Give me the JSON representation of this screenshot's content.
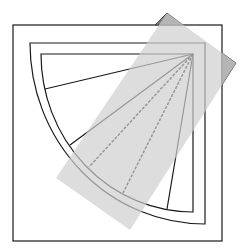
{
  "diagram": {
    "colors": {
      "background": "#ffffff",
      "stroke": "#1a1a1a",
      "overlay_fill": "#d9d9d9",
      "overlay_opacity": 0.85,
      "overlay_tip_fill": "#7a7a7a"
    },
    "outer_square": {
      "x": 13,
      "y": 25,
      "w": 209,
      "h": 216
    },
    "middle_frame": {
      "x": 30,
      "y": 43,
      "right": 205,
      "bottom": 224
    },
    "inner_frame": {
      "x": 41,
      "y": 54,
      "right": 193,
      "bottom": 212
    },
    "apex": {
      "x": 193,
      "y": 54
    },
    "rays": [
      {
        "end_x": 45,
        "end_y": 89,
        "style": "solid"
      },
      {
        "end_x": 70,
        "end_y": 145,
        "style": "solid"
      },
      {
        "end_x": 89,
        "end_y": 167,
        "style": "dashed"
      },
      {
        "end_x": 123,
        "end_y": 193,
        "style": "dashed"
      },
      {
        "end_x": 167,
        "end_y": 209,
        "style": "solid"
      }
    ],
    "overlay_rect": {
      "points": [
        [
          167,
          13
        ],
        [
          236,
          63
        ],
        [
          130,
          230
        ],
        [
          56,
          178
        ]
      ]
    }
  }
}
